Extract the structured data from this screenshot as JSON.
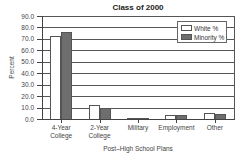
{
  "chart_data": {
    "type": "bar",
    "title": "Class of 2000",
    "xlabel": "Post–High School Plans",
    "ylabel": "Percent",
    "ylim": [
      0,
      90
    ],
    "yticks": [
      "0.0",
      "10.0",
      "20.0",
      "30.0",
      "40.0",
      "50.0",
      "60.0",
      "70.0",
      "80.0",
      "90.0"
    ],
    "grid": true,
    "legend_position": "upper right",
    "categories": [
      "4-Year College",
      "2-Year College",
      "Military",
      "Employment",
      "Other"
    ],
    "category_lines": [
      [
        "4-Year",
        "College"
      ],
      [
        "2-Year",
        "College"
      ],
      [
        "Military"
      ],
      [
        "Employment"
      ],
      [
        "Other"
      ]
    ],
    "series": [
      {
        "name": "White %",
        "color": "#ffffff",
        "values": [
          73,
          13,
          1.5,
          4.5,
          6.5
        ]
      },
      {
        "name": "Minority %",
        "color": "#6e6e6e",
        "values": [
          77,
          10.5,
          2,
          4.5,
          5
        ]
      }
    ]
  },
  "colors": {
    "white_bar": "#ffffff",
    "minority_bar": "#6e6e6e",
    "axis": "#444444",
    "grid": "#555555"
  }
}
